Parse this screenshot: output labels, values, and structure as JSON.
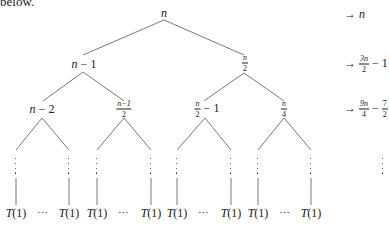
{
  "header_text": "below.",
  "tree": {
    "root": {
      "label": "n"
    },
    "level1": [
      {
        "parts": [
          "n",
          " − 1"
        ],
        "kind": "expr"
      },
      {
        "kind": "frac",
        "num": "n",
        "den": "2"
      }
    ],
    "level2": [
      {
        "kind": "expr",
        "parts": [
          "n",
          " − 2"
        ]
      },
      {
        "kind": "frac",
        "num": "n−1",
        "den": "2"
      },
      {
        "kind": "frac-expr",
        "num": "n",
        "den": "2",
        "suffix": " − 1"
      },
      {
        "kind": "frac",
        "num": "n",
        "den": "4"
      }
    ],
    "leaf_label": "T(1)",
    "leaf_ellipsis": "⋯",
    "vertical_ellipsis": "⋮"
  },
  "level_sums": [
    {
      "arrow": "→",
      "text": "n"
    },
    {
      "arrow": "→",
      "frac_num": "3n",
      "frac_den": "2",
      "suffix": " − 1"
    },
    {
      "arrow": "→",
      "frac_num": "9n",
      "frac_den": "4",
      "minus": " − ",
      "frac2_num": "7",
      "frac2_den": "2"
    },
    {
      "arrow": "",
      "text": "⋮"
    }
  ]
}
